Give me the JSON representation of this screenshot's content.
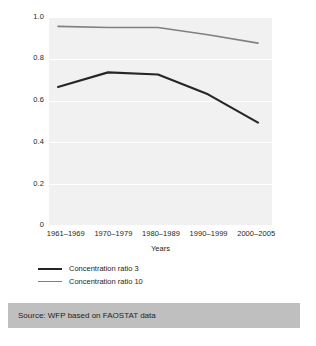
{
  "chart_data": {
    "type": "line",
    "title": "",
    "subtitle": "",
    "xlabel": "Years",
    "ylabel": "",
    "categories": [
      "1961–1969",
      "1970–1979",
      "1980–1989",
      "1990–1999",
      "2000–2005"
    ],
    "series": [
      {
        "name": "Concentration ratio 3",
        "color": "#262626",
        "values": [
          0.665,
          0.735,
          0.725,
          0.63,
          0.495
        ]
      },
      {
        "name": "Concentration ratio 10",
        "color": "#808080",
        "values": [
          0.955,
          0.95,
          0.95,
          0.915,
          0.875
        ]
      }
    ],
    "ylim": [
      0,
      1.0
    ],
    "yticks": [
      "1.0",
      "0.8",
      "0.6",
      "0.4",
      "0.2",
      "0"
    ],
    "ytick_values": [
      1.0,
      0.8,
      0.6,
      0.4,
      0.2,
      0
    ],
    "grid": "horizontal-white",
    "legend_position": "below-axis-left",
    "plot_background": "#f1f1f1"
  },
  "axes": {
    "y": {
      "ticks": [
        {
          "label": "1.0"
        },
        {
          "label": "0.8"
        },
        {
          "label": "0.6"
        },
        {
          "label": "0.4"
        },
        {
          "label": "0.2"
        },
        {
          "label": "0"
        }
      ]
    },
    "x": {
      "title": "Years",
      "ticks": [
        {
          "label": "1961–1969"
        },
        {
          "label": "1970–1979"
        },
        {
          "label": "1980–1989"
        },
        {
          "label": "1990–1999"
        },
        {
          "label": "2000–2005"
        }
      ]
    }
  },
  "legend": {
    "entries": [
      {
        "label": "Concentration ratio 3",
        "color": "#262626"
      },
      {
        "label": "Concentration ratio 10",
        "color": "#808080"
      }
    ]
  },
  "source": {
    "text": "Source: WFP based on FAOSTAT data",
    "band_color": "#bfbfbf"
  }
}
